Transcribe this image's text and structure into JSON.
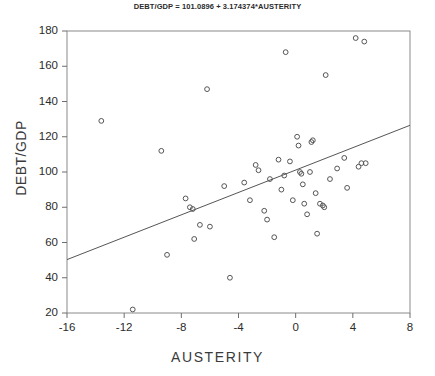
{
  "chart_data": {
    "type": "scatter",
    "title": "DEBT/GDP = 101.0896 + 3.174374*AUSTERITY",
    "xlabel": "AUSTERITY",
    "ylabel": "DEBT/GDP",
    "xlim": [
      -16,
      8
    ],
    "ylim": [
      20,
      180
    ],
    "xticks": [
      -16,
      -12,
      -8,
      -4,
      0,
      4,
      8
    ],
    "yticks": [
      20,
      40,
      60,
      80,
      100,
      120,
      140,
      160,
      180
    ],
    "grid": false,
    "legend": "none",
    "marker": "open-circle",
    "marker_color": "#555555",
    "line_color": "#555555",
    "regression": {
      "intercept": 101.0896,
      "slope": 3.174374,
      "x_start": -16,
      "x_end": 8,
      "y_start": 50.3,
      "y_end": 126.5,
      "equation": "DEBT/GDP = 101.0896 + 3.174374*AUSTERITY"
    },
    "points": [
      {
        "x": -13.6,
        "y": 129
      },
      {
        "x": -11.4,
        "y": 22
      },
      {
        "x": -9.4,
        "y": 112
      },
      {
        "x": -9.0,
        "y": 53
      },
      {
        "x": -7.7,
        "y": 85
      },
      {
        "x": -7.4,
        "y": 80
      },
      {
        "x": -7.2,
        "y": 79
      },
      {
        "x": -7.1,
        "y": 62
      },
      {
        "x": -6.7,
        "y": 70
      },
      {
        "x": -6.2,
        "y": 147
      },
      {
        "x": -6.0,
        "y": 69
      },
      {
        "x": -5.0,
        "y": 92
      },
      {
        "x": -4.6,
        "y": 40
      },
      {
        "x": -3.6,
        "y": 94
      },
      {
        "x": -3.2,
        "y": 84
      },
      {
        "x": -2.8,
        "y": 104
      },
      {
        "x": -2.6,
        "y": 101
      },
      {
        "x": -2.2,
        "y": 78
      },
      {
        "x": -2.0,
        "y": 73
      },
      {
        "x": -1.8,
        "y": 96
      },
      {
        "x": -1.5,
        "y": 63
      },
      {
        "x": -1.2,
        "y": 107
      },
      {
        "x": -1.0,
        "y": 90
      },
      {
        "x": -0.8,
        "y": 98
      },
      {
        "x": -0.7,
        "y": 168
      },
      {
        "x": -0.4,
        "y": 106
      },
      {
        "x": -0.2,
        "y": 84
      },
      {
        "x": 0.1,
        "y": 120
      },
      {
        "x": 0.2,
        "y": 115
      },
      {
        "x": 0.3,
        "y": 100
      },
      {
        "x": 0.4,
        "y": 99
      },
      {
        "x": 0.5,
        "y": 93
      },
      {
        "x": 0.6,
        "y": 82
      },
      {
        "x": 0.8,
        "y": 76
      },
      {
        "x": 1.0,
        "y": 100
      },
      {
        "x": 1.1,
        "y": 117
      },
      {
        "x": 1.2,
        "y": 118
      },
      {
        "x": 1.4,
        "y": 88
      },
      {
        "x": 1.5,
        "y": 65
      },
      {
        "x": 1.7,
        "y": 82
      },
      {
        "x": 1.9,
        "y": 81
      },
      {
        "x": 2.0,
        "y": 80
      },
      {
        "x": 2.1,
        "y": 155
      },
      {
        "x": 2.4,
        "y": 96
      },
      {
        "x": 2.9,
        "y": 102
      },
      {
        "x": 3.4,
        "y": 108
      },
      {
        "x": 3.6,
        "y": 91
      },
      {
        "x": 4.2,
        "y": 176
      },
      {
        "x": 4.4,
        "y": 103
      },
      {
        "x": 4.6,
        "y": 105
      },
      {
        "x": 4.8,
        "y": 174
      },
      {
        "x": 4.9,
        "y": 105
      }
    ]
  }
}
